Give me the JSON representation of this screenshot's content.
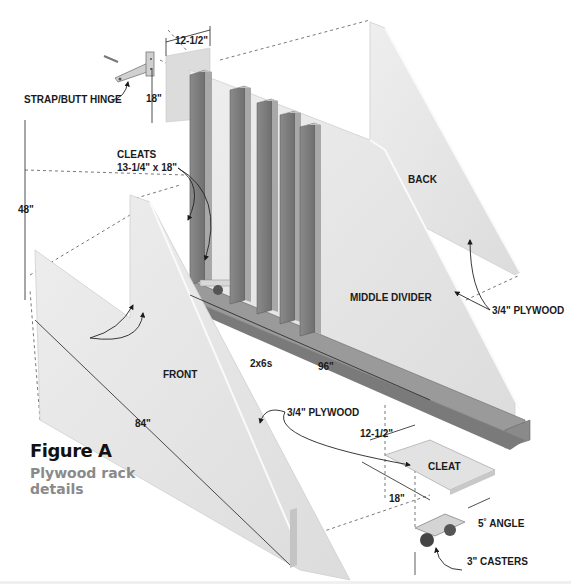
{
  "figure": {
    "title": "Figure A",
    "subtitle": "Plywood rack details"
  },
  "parts": {
    "back": "BACK",
    "middle_divider": "MIDDLE DIVIDER",
    "front": "FRONT",
    "cleat": "CLEAT"
  },
  "callouts": {
    "strap_butt_hinge": "STRAP/BUTT HINGE",
    "cleats_title": "CLEATS",
    "cleats_size": "13-1/4\" x 18\"",
    "plywood_back": "3/4\" PLYWOOD",
    "plywood_front": "3/4\" PLYWOOD",
    "two_by_sixes": "2x6s",
    "angle": "5˚ ANGLE",
    "casters": "3\" CASTERS"
  },
  "dimensions": {
    "hinge_panel_width": "12-1/2\"",
    "hinge_panel_height": "18\"",
    "height": "48\"",
    "depth": "84\"",
    "length": "96\"",
    "cleat_width": "12-1/2\"",
    "cleat_length": "18\""
  },
  "colors": {
    "panel_light": "#e6e6e6",
    "panel_edge": "#f7f7f7",
    "lumber_dark": "#7a7a7a",
    "lumber_face": "#8e8e8e",
    "lumber_top": "#b4b4b4",
    "subtitle_gray": "#8a8a8a"
  }
}
